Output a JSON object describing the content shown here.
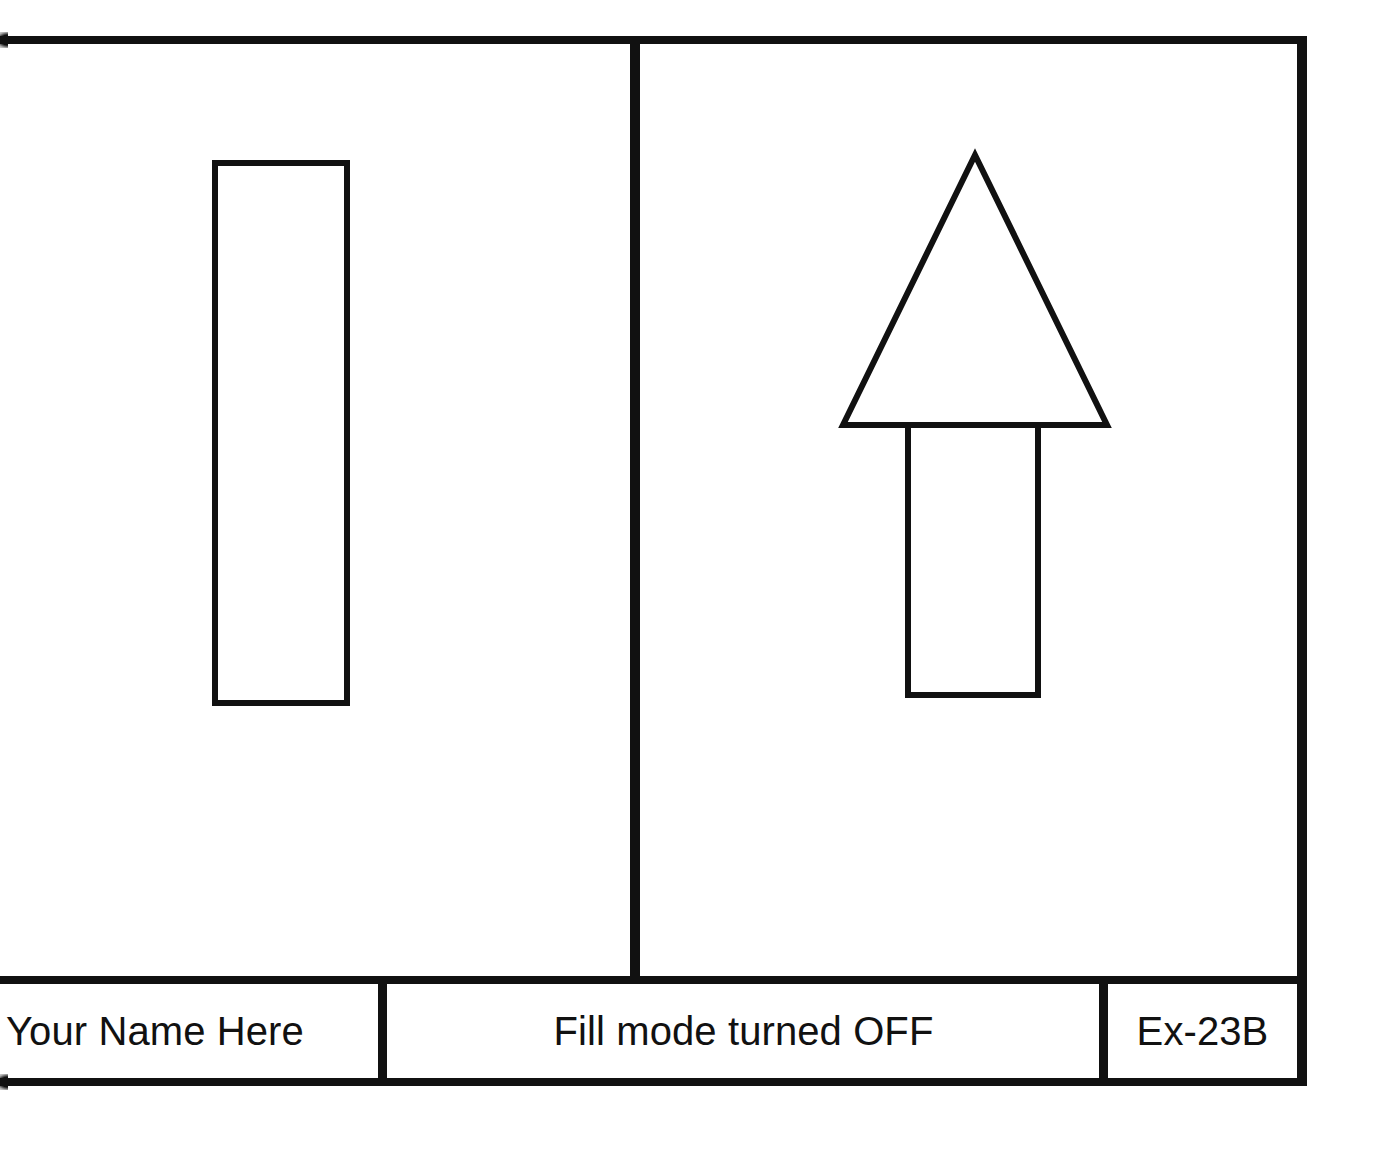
{
  "sheet": {
    "background_color": "#ffffff",
    "line_color": "#111111",
    "title": "CAD Drawing Sheet"
  },
  "title_block": {
    "name_label": "Your Name Here",
    "status_label": "Fill mode turned OFF",
    "drawing_number": "Ex-23B"
  },
  "viewports": [
    {
      "id": "left",
      "shapes": [
        {
          "name": "rectangle",
          "type": "rect",
          "x": 215,
          "y": 163,
          "width": 132,
          "height": 540,
          "filled": false
        }
      ]
    },
    {
      "id": "right",
      "shapes": [
        {
          "name": "arrow-head-triangle",
          "type": "polygon",
          "points": "975,155 1107,425 843,425",
          "filled": false
        },
        {
          "name": "arrow-shaft",
          "type": "polyline",
          "points": "908,425 908,695 1038,695 1038,425",
          "filled": false
        }
      ]
    }
  ]
}
